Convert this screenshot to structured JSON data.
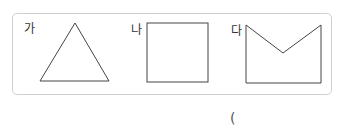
{
  "figures": [
    {
      "label": "가",
      "shape": "triangle"
    },
    {
      "label": "나",
      "shape": "square"
    },
    {
      "label": "다",
      "shape": "pentagon-notched"
    }
  ],
  "answer": {
    "open_paren": "("
  },
  "colors": {
    "stroke": "#444444",
    "border": "#cfcfcf"
  }
}
